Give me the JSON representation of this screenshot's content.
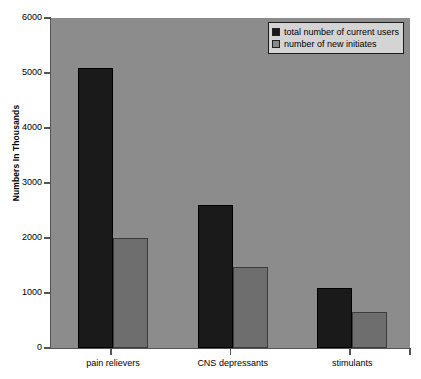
{
  "chart_data": {
    "type": "bar",
    "title": "",
    "xlabel": "",
    "ylabel": "Numbers In Thousands",
    "categories": [
      "pain relievers",
      "CNS depressants",
      "stimulants"
    ],
    "series": [
      {
        "name": "total number of current users",
        "color": "#1a1a1a",
        "values": [
          5100,
          2600,
          1100
        ]
      },
      {
        "name": "number of new initiates",
        "color": "#6e6e6e",
        "values": [
          2000,
          1470,
          650
        ]
      }
    ],
    "ylim": [
      0,
      6000
    ],
    "yticks": [
      0,
      1000,
      2000,
      3000,
      4000,
      5000,
      6000
    ],
    "ytick_labels": [
      "0",
      "1000",
      "2000",
      "3000",
      "4000",
      "5000",
      "6000"
    ],
    "grid": false,
    "legend_position": "top-right",
    "plot_background": "#8c8c8c",
    "page_background": "#ffffff"
  }
}
